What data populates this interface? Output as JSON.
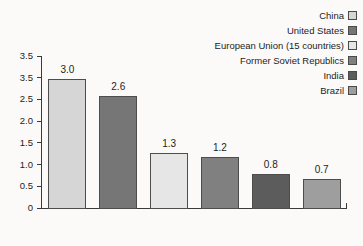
{
  "chart_data": {
    "type": "bar",
    "title": "",
    "subtitle": "",
    "xlabel": "",
    "ylabel": "",
    "categories": [
      "China",
      "United States",
      "European Union (15 countries)",
      "Former Soviet Republics",
      "India",
      "Brazil"
    ],
    "values": [
      3.0,
      2.6,
      1.3,
      1.2,
      0.8,
      0.7
    ],
    "value_labels": [
      "3.0",
      "2.6",
      "1.3",
      "1.2",
      "0.8",
      "0.7"
    ],
    "bar_colors": [
      "#d6d6d6",
      "#767676",
      "#e6e6e6",
      "#808080",
      "#5c5c5c",
      "#9e9e9e"
    ],
    "ylim": [
      0,
      3.5
    ],
    "ytick_labels": [
      "3.5",
      "3.5",
      "2.5",
      "2.0",
      "1.5",
      "1.0",
      "0.5",
      "0"
    ],
    "ytick_values": [
      3.5,
      3.0,
      2.5,
      2.0,
      1.5,
      1.0,
      0.5,
      0
    ],
    "grid": false,
    "legend_position": "top-right",
    "legend": [
      {
        "label": "China",
        "color": "#d6d6d6"
      },
      {
        "label": "United States",
        "color": "#767676"
      },
      {
        "label": "European Union (15 countries)",
        "color": "#e6e6e6"
      },
      {
        "label": "Former Soviet Republics",
        "color": "#808080"
      },
      {
        "label": "India",
        "color": "#5c5c5c"
      },
      {
        "label": "Brazil",
        "color": "#9e9e9e"
      }
    ]
  }
}
